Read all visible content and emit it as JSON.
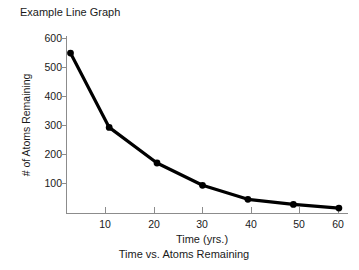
{
  "chart_data": {
    "type": "line",
    "title": "Example Line Graph",
    "caption": "Time vs. Atoms Remaining",
    "xlabel": "Time (yrs.)",
    "ylabel": "# of Atoms Remaining",
    "x": [
      1,
      9.5,
      20,
      30,
      40,
      50,
      60
    ],
    "values": [
      560,
      300,
      175,
      97,
      48,
      30,
      17
    ],
    "series": [
      {
        "name": "# of Atoms Remaining",
        "x": [
          1,
          9.5,
          20,
          30,
          40,
          50,
          60
        ],
        "values": [
          560,
          300,
          175,
          97,
          48,
          30,
          17
        ]
      }
    ],
    "xlim": [
      0,
      62
    ],
    "ylim": [
      0,
      620
    ],
    "xticks": [
      10,
      20,
      30,
      40,
      50,
      60
    ],
    "xtick_labels": [
      "10",
      "20",
      "30",
      "40",
      "50",
      "60"
    ],
    "yticks": [
      100,
      200,
      300,
      400,
      500,
      600
    ],
    "ytick_labels": [
      "100",
      "200",
      "300",
      "400",
      "500",
      "600"
    ],
    "grid": false,
    "legend": false,
    "marker": "filled-circle",
    "line_color": "#000000",
    "marker_color": "#000000",
    "axis_color": "#8c8c8c",
    "background_color": "#ffffff"
  }
}
